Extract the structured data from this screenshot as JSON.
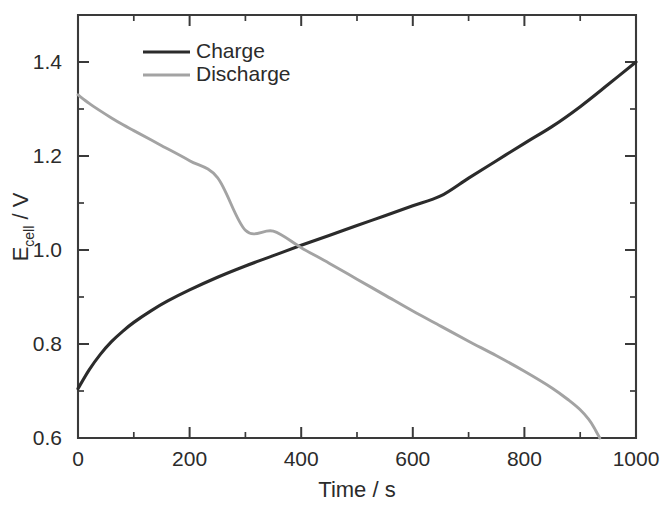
{
  "chart_data": {
    "type": "line",
    "title": "",
    "xlabel": "Time / s",
    "ylabel_main": "E",
    "ylabel_sub": "cell",
    "ylabel_unit": " / V",
    "ylabel_full": "E_cell / V",
    "xlim": [
      0,
      1000
    ],
    "ylim": [
      0.6,
      1.5
    ],
    "xticks": [
      0,
      200,
      400,
      600,
      800,
      1000
    ],
    "xtick_labels": [
      "0",
      "200",
      "400",
      "600",
      "800",
      "1000"
    ],
    "xminor_step": 100,
    "yticks": [
      0.6,
      0.8,
      1.0,
      1.2,
      1.4
    ],
    "ytick_labels": [
      "0.6",
      "0.8",
      "1.0",
      "1.2",
      "1.4"
    ],
    "yminor_step": 0.1,
    "grid": false,
    "legend_position": "top-left-inside",
    "frame": "box",
    "series": [
      {
        "name": "Charge",
        "color": "#2b2b2b",
        "width": 3.1,
        "x": [
          0,
          20,
          40,
          60,
          80,
          100,
          130,
          160,
          200,
          250,
          300,
          350,
          400,
          450,
          500,
          550,
          600,
          650,
          700,
          750,
          800,
          850,
          900,
          950,
          1000
        ],
        "y": [
          0.705,
          0.745,
          0.778,
          0.805,
          0.827,
          0.846,
          0.87,
          0.891,
          0.915,
          0.942,
          0.966,
          0.988,
          1.01,
          1.031,
          1.052,
          1.073,
          1.094,
          1.115,
          1.153,
          1.19,
          1.227,
          1.263,
          1.305,
          1.352,
          1.4
        ]
      },
      {
        "name": "Discharge",
        "color": "#a3a3a3",
        "width": 2.9,
        "x": [
          0,
          20,
          40,
          60,
          80,
          100,
          150,
          200,
          250,
          300,
          350,
          400,
          450,
          500,
          550,
          600,
          650,
          700,
          750,
          800,
          850,
          880,
          900,
          915,
          925,
          935
        ],
        "y": [
          1.33,
          1.312,
          1.296,
          1.281,
          1.267,
          1.254,
          1.222,
          1.19,
          1.154,
          1.042,
          1.04,
          1.005,
          0.972,
          0.938,
          0.904,
          0.87,
          0.838,
          0.806,
          0.775,
          0.742,
          0.706,
          0.68,
          0.66,
          0.64,
          0.622,
          0.6
        ]
      }
    ],
    "annotations": {
      "crossover_time_s": 310,
      "crossover_voltage_v": 1.02,
      "charge_start_v": 0.705,
      "charge_end_v": 1.4,
      "discharge_start_v": 1.33,
      "discharge_end_time_s": 935,
      "discharge_end_v": 0.6
    }
  },
  "legend": {
    "entries": [
      {
        "label": "Charge"
      },
      {
        "label": "Discharge"
      }
    ]
  }
}
